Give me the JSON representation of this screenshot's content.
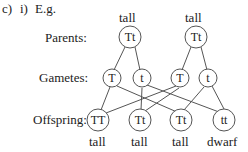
{
  "question": {
    "part": "c)",
    "subpart": "i)",
    "intro": "E.g."
  },
  "rows": {
    "parents_label": "Parents:",
    "gametes_label": "Gametes:",
    "offspring_label": "Offspring:"
  },
  "parents": [
    {
      "genotype": "Tt",
      "phenotype": "tall"
    },
    {
      "genotype": "Tt",
      "phenotype": "tall"
    }
  ],
  "gametes": [
    {
      "allele": "T"
    },
    {
      "allele": "t"
    },
    {
      "allele": "T"
    },
    {
      "allele": "t"
    }
  ],
  "offspring": [
    {
      "genotype": "TT",
      "phenotype": "tall"
    },
    {
      "genotype": "Tt",
      "phenotype": "tall"
    },
    {
      "genotype": "Tt",
      "phenotype": "tall"
    },
    {
      "genotype": "tt",
      "phenotype": "dwarf"
    }
  ]
}
